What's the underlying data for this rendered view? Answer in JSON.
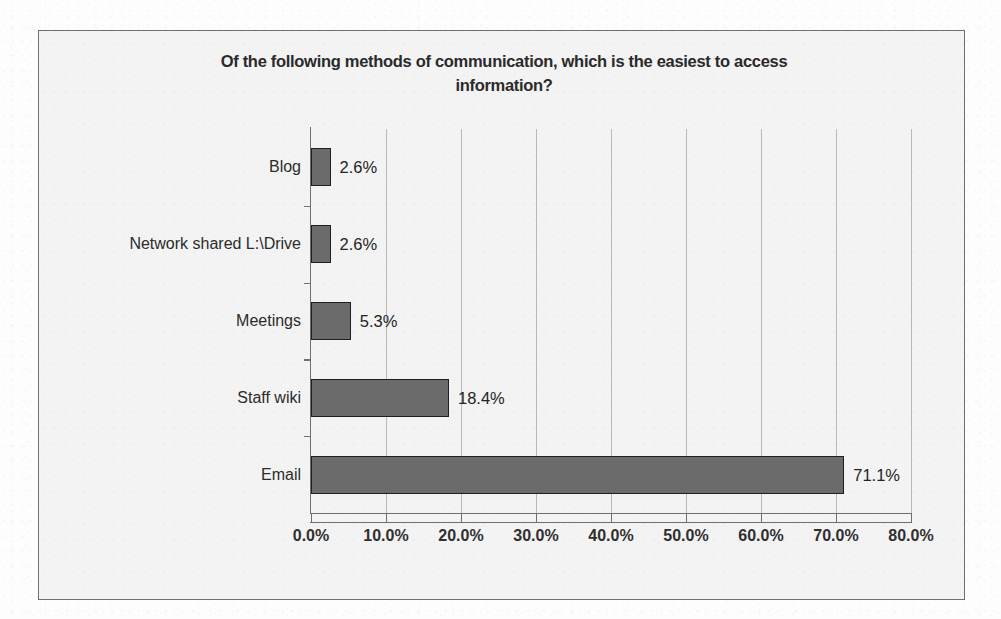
{
  "chart_data": {
    "type": "bar",
    "orientation": "horizontal",
    "title": "Of the following methods of communication, which is the easiest to access information?",
    "title_line1": "Of the following methods of communication, which is the easiest to access",
    "title_line2": "information?",
    "categories": [
      "Email",
      "Staff wiki",
      "Meetings",
      "Network shared L:\\Drive",
      "Blog"
    ],
    "values": [
      71.1,
      18.4,
      5.3,
      2.6,
      2.6
    ],
    "value_labels": [
      "71.1%",
      "18.4%",
      "5.3%",
      "2.6%",
      "2.6%"
    ],
    "xlabel": "",
    "ylabel": "",
    "xlim": [
      0,
      80
    ],
    "x_tick_values": [
      0,
      10,
      20,
      30,
      40,
      50,
      60,
      70,
      80
    ],
    "x_tick_labels": [
      "0.0%",
      "10.0%",
      "20.0%",
      "30.0%",
      "40.0%",
      "50.0%",
      "60.0%",
      "70.0%",
      "80.0%"
    ],
    "grid": "vertical",
    "legend": "none",
    "bar_color": "#6b6b6b",
    "bar_border_color": "#1f1f1f",
    "gridline_color": "#b9b9b9",
    "axis_color": "#6f6f6f",
    "plot_background": "#f3f3f3",
    "text_color": "#2a2a2a"
  }
}
